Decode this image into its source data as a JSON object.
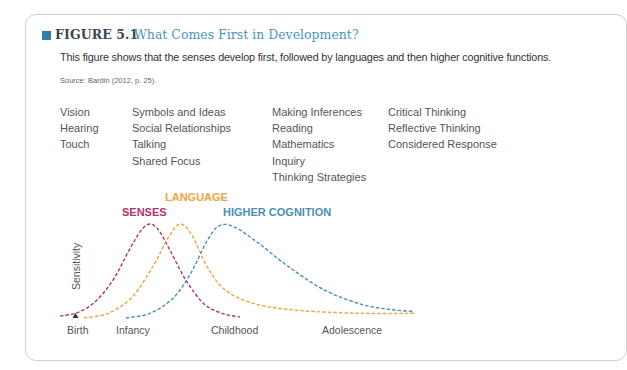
{
  "figure": {
    "number": "FIGURE 5.1",
    "title": "What Comes First in Development?",
    "subtitle": "This figure shows that the senses develop first, followed by languages and then higher cognitive functions.",
    "source": "Source: Bardin (2012, p. 25)."
  },
  "columns": [
    {
      "items": [
        "Vision",
        "Hearing",
        "Touch"
      ]
    },
    {
      "items": [
        "Symbols and Ideas",
        "Social Relationships",
        "Talking",
        "Shared Focus"
      ]
    },
    {
      "items": [
        "Making Inferences",
        "Reading",
        "Mathematics",
        "Inquiry",
        "Thinking Strategies"
      ]
    },
    {
      "items": [
        "Critical Thinking",
        "Reflective Thinking",
        "Considered Response"
      ]
    }
  ],
  "colors": {
    "accent_square": "#2f7fae",
    "senses": "#b0336f",
    "language": "#eea440",
    "higher_cognition": "#4a8fb5"
  },
  "chart_data": {
    "type": "line",
    "title": "",
    "xlabel": "",
    "ylabel": "Sensitivity",
    "x_ticks": [
      "Birth",
      "Infancy",
      "Childhood",
      "Adolescence"
    ],
    "x_marker": "Birth",
    "x_range": [
      0,
      10
    ],
    "ylim": [
      0,
      1
    ],
    "grid": false,
    "legend": "inline labels above peaks",
    "line_style": "dashed",
    "series": [
      {
        "name": "SENSES",
        "color": "#b0336f",
        "x": [
          0.0,
          0.6,
          1.2,
          1.8,
          2.3,
          2.7,
          3.0,
          3.3,
          3.7,
          4.2,
          4.8,
          5.4,
          6.0
        ],
        "y": [
          0.02,
          0.06,
          0.18,
          0.42,
          0.72,
          0.93,
          1.0,
          0.93,
          0.7,
          0.4,
          0.15,
          0.05,
          0.01
        ]
      },
      {
        "name": "LANGUAGE",
        "color": "#eea440",
        "x": [
          0.8,
          1.6,
          2.4,
          3.1,
          3.6,
          4.0,
          4.4,
          4.9,
          5.5,
          6.5,
          8.0,
          10.0,
          11.8
        ],
        "y": [
          0.0,
          0.05,
          0.22,
          0.55,
          0.85,
          1.0,
          0.88,
          0.55,
          0.3,
          0.15,
          0.08,
          0.05,
          0.05
        ]
      },
      {
        "name": "HIGHER COGNITION",
        "color": "#4a8fb5",
        "x": [
          2.2,
          3.0,
          3.8,
          4.4,
          4.9,
          5.3,
          5.8,
          6.6,
          7.6,
          8.8,
          10.0,
          11.0,
          11.8
        ],
        "y": [
          0.0,
          0.05,
          0.22,
          0.5,
          0.82,
          0.98,
          0.97,
          0.8,
          0.55,
          0.3,
          0.15,
          0.09,
          0.07
        ]
      }
    ]
  }
}
